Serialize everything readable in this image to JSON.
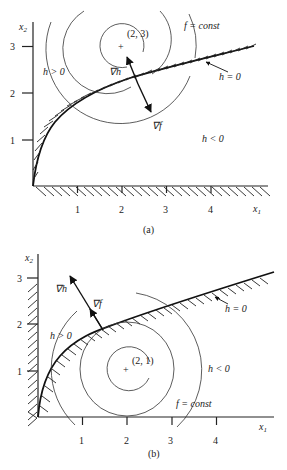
{
  "figure": {
    "panels": [
      {
        "id": "a",
        "caption": "(a)",
        "x_axis_label": "x",
        "x_axis_sub": "1",
        "y_axis_label": "x",
        "y_axis_sub": "2",
        "x_ticks": [
          "1",
          "2",
          "3",
          "4"
        ],
        "y_ticks": [
          "1",
          "2",
          "3"
        ],
        "center_label": "(2, 3)",
        "center_marker": "+",
        "contour_label": "f = const",
        "boundary_label": "h = 0",
        "feasible_above_label": "h > 0",
        "feasible_below_label": "h < 0",
        "grad_h_label": "∇h",
        "grad_f_label": "∇f"
      },
      {
        "id": "b",
        "caption": "(b)",
        "x_axis_label": "x",
        "x_axis_sub": "1",
        "y_axis_label": "x",
        "y_axis_sub": "2",
        "x_ticks": [
          "1",
          "2",
          "3",
          "4"
        ],
        "y_ticks": [
          "1",
          "2",
          "3"
        ],
        "center_label": "(2, 1)",
        "center_marker": "+",
        "contour_label": "f = const",
        "boundary_label": "h = 0",
        "feasible_above_label": "h > 0",
        "feasible_below_label": "h < 0",
        "grad_h_label": "∇h",
        "grad_f_label": "∇f"
      }
    ]
  }
}
